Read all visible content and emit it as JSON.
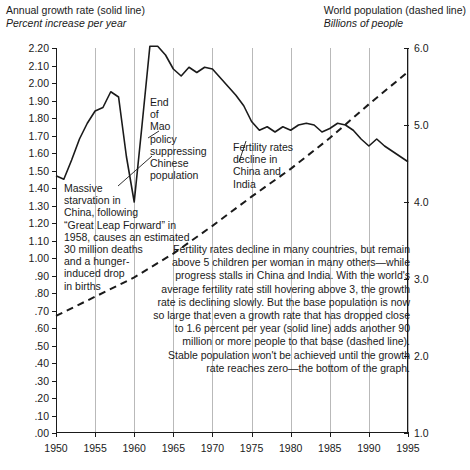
{
  "header": {
    "left_title": "Annual growth rate (solid line)",
    "left_subtitle": "Percent increase per year",
    "right_title": "World population (dashed line)",
    "right_subtitle": "Billions of people"
  },
  "annotations": {
    "starvation": "Massive\nstarvation in\nChina, following\n“Great Leap Forward” in\n1958, causes an estimated\n30 million deaths\nand a hunger-\ninduced drop\nin births",
    "mao": "End\nof\nMao\npolicy\nsuppressing\nChinese\npopulation",
    "fertility": "Fertility rates\ndecline in\nChina and\nIndia",
    "paragraph": "Fertility rates decline in many countries, but remain above 5 children per woman in many others—while progress stalls in China and India. With the world's average fertility rate still hovering above 3, the growth rate is declining slowly. But the base population is now so large that even a growth rate that has dropped close to 1.6 percent per year (solid line) adds another 90 million or more people to that base (dashed line). Stable population won't be achieved until the growth rate reaches zero—the bottom of the graph."
  },
  "chart_data": {
    "type": "line",
    "title": "",
    "xlabel": "",
    "ylabel": "Percent increase per year",
    "y2label": "Billions of people",
    "grid": true,
    "legend_position": "none",
    "xlim": [
      1950,
      1995
    ],
    "ylim": [
      0.0,
      2.2
    ],
    "y2lim": [
      1.0,
      6.0
    ],
    "xticks": [
      "1950",
      "1955",
      "1960",
      "1965",
      "1970",
      "1975",
      "1980",
      "1985",
      "1990",
      "1995"
    ],
    "yticks": [
      "2.20",
      "2.10",
      "2.00",
      "1.90",
      "1.80",
      "1.70",
      "1.60",
      "1.50",
      "1.40",
      "1.30",
      "1.20",
      "1.10",
      "1.00",
      ".90",
      ".80",
      ".70",
      ".60",
      ".50",
      ".40",
      ".30",
      ".20",
      ".10",
      ".00"
    ],
    "y2ticks": [
      "6.0",
      "5.0",
      "4.0",
      "3.0",
      "2.0",
      "1.0"
    ],
    "series": [
      {
        "name": "Annual growth rate (solid line)",
        "axis": "left",
        "style": "solid",
        "x": [
          1950,
          1951,
          1952,
          1953,
          1954,
          1955,
          1956,
          1957,
          1958,
          1959,
          1960,
          1961,
          1962,
          1963,
          1964,
          1965,
          1966,
          1967,
          1968,
          1969,
          1970,
          1971,
          1972,
          1973,
          1974,
          1975,
          1976,
          1977,
          1978,
          1979,
          1980,
          1981,
          1982,
          1983,
          1984,
          1985,
          1986,
          1987,
          1988,
          1989,
          1990,
          1991,
          1992,
          1993,
          1994,
          1995
        ],
        "values": [
          1.47,
          1.45,
          1.56,
          1.68,
          1.77,
          1.84,
          1.86,
          1.95,
          1.92,
          1.58,
          1.32,
          1.76,
          2.21,
          2.21,
          2.16,
          2.08,
          2.04,
          2.09,
          2.06,
          2.09,
          2.08,
          2.03,
          1.98,
          1.93,
          1.87,
          1.78,
          1.73,
          1.75,
          1.72,
          1.75,
          1.73,
          1.76,
          1.77,
          1.76,
          1.72,
          1.74,
          1.77,
          1.76,
          1.73,
          1.68,
          1.64,
          1.68,
          1.64,
          1.61,
          1.58,
          1.55
        ]
      },
      {
        "name": "World population (dashed line)",
        "axis": "right",
        "style": "dashed",
        "x": [
          1950,
          1955,
          1960,
          1965,
          1970,
          1975,
          1980,
          1985,
          1990,
          1995
        ],
        "values": [
          2.52,
          2.77,
          3.02,
          3.33,
          3.69,
          4.07,
          4.43,
          4.83,
          5.27,
          5.69
        ]
      }
    ]
  }
}
